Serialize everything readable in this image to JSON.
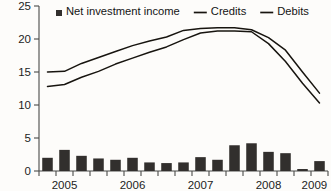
{
  "chart_data": {
    "type": "bar",
    "title": "",
    "xlabel": "",
    "ylabel": "",
    "ylim": [
      0,
      25
    ],
    "yticks": [
      0,
      5,
      10,
      15,
      20,
      25
    ],
    "ytick_labels": [
      "0",
      "5",
      "10",
      "15",
      "20",
      "25"
    ],
    "grid": false,
    "legend_position": "top-inside",
    "x": [
      "2005Q1",
      "2005Q2",
      "2005Q3",
      "2005Q4",
      "2006Q1",
      "2006Q2",
      "2006Q3",
      "2006Q4",
      "2007Q1",
      "2007Q2",
      "2007Q3",
      "2007Q4",
      "2008Q1",
      "2008Q2",
      "2008Q3",
      "2008Q4",
      "2009Q1"
    ],
    "categories": [
      "2005Q1",
      "2005Q2",
      "2005Q3",
      "2005Q4",
      "2006Q1",
      "2006Q2",
      "2006Q3",
      "2006Q4",
      "2007Q1",
      "2007Q2",
      "2007Q3",
      "2007Q4",
      "2008Q1",
      "2008Q2",
      "2008Q3",
      "2008Q4",
      "2009Q1"
    ],
    "xtick_labels": [
      "2005",
      "2006",
      "2007",
      "2008",
      "2009"
    ],
    "xtick_label_positions": [
      1.5,
      5.5,
      9.5,
      13.5,
      16.2
    ],
    "series": [
      {
        "name": "Net investment income",
        "kind": "bar",
        "color": "#322f2d",
        "values": [
          2.0,
          3.2,
          2.3,
          1.9,
          1.7,
          2.0,
          1.3,
          1.2,
          1.3,
          2.1,
          1.7,
          3.9,
          4.2,
          2.9,
          2.7,
          0.3,
          1.5
        ]
      },
      {
        "name": "Credits",
        "kind": "line",
        "color": "#17140f",
        "values": [
          15.0,
          15.1,
          16.3,
          17.2,
          18.1,
          19.0,
          19.7,
          20.3,
          21.3,
          21.6,
          21.7,
          21.7,
          21.4,
          20.2,
          18.3,
          15.0,
          11.8
        ]
      },
      {
        "name": "Debits",
        "kind": "line",
        "color": "#17140f",
        "values": [
          12.8,
          13.1,
          14.2,
          15.1,
          16.2,
          17.1,
          18.0,
          18.8,
          19.9,
          20.9,
          21.2,
          21.2,
          21.1,
          19.3,
          16.6,
          13.3,
          10.3
        ]
      }
    ]
  },
  "legend": {
    "items": [
      {
        "label": "Net investment income",
        "marker": "square",
        "color": "#322f2d"
      },
      {
        "label": "Credits",
        "marker": "line",
        "color": "#17140f"
      },
      {
        "label": "Debits",
        "marker": "line",
        "color": "#17140f"
      }
    ]
  }
}
